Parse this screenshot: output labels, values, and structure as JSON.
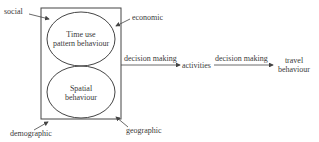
{
  "diagram": {
    "factors": {
      "social": "social",
      "economic": "economic",
      "demographic": "demographic",
      "geographic": "geographic"
    },
    "ellipses": {
      "top": {
        "line1": "Time use",
        "line2": "pattern behaviour"
      },
      "bottom": {
        "line1": "Spatial",
        "line2": "behaviour"
      }
    },
    "arrows": {
      "first_label": "decision making",
      "second_label": "decision making"
    },
    "nodes": {
      "activities": "activities",
      "travel_line1": "travel",
      "travel_line2": "behaviour"
    },
    "colors": {
      "stroke": "#444444",
      "text": "#3a3a3a",
      "background": "#ffffff"
    }
  }
}
